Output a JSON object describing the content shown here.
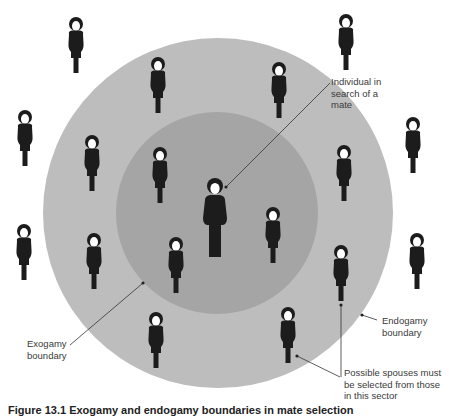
{
  "diagram": {
    "colors": {
      "background": "#ffffff",
      "outer_ring": "#bdbdbd",
      "inner_circle": "#a5a5a5",
      "figure": "#1c1c1c",
      "face": "#ffffff",
      "leader_line": "#333333"
    },
    "circles": {
      "outer": {
        "name": "endogamy-zone",
        "cx": 218,
        "cy": 213,
        "r": 175
      },
      "inner": {
        "name": "exogamy-zone",
        "cx": 217,
        "cy": 213,
        "r": 101
      }
    },
    "focal_individual": {
      "x": 215,
      "y": 178,
      "scale": 1.35
    },
    "figures": [
      {
        "zone": "outside",
        "x": 76,
        "y": 17
      },
      {
        "zone": "outside",
        "x": 346,
        "y": 14
      },
      {
        "zone": "outside",
        "x": 25,
        "y": 110
      },
      {
        "zone": "outside",
        "x": 413,
        "y": 117
      },
      {
        "zone": "outside",
        "x": 24,
        "y": 224
      },
      {
        "zone": "outside",
        "x": 417,
        "y": 233
      },
      {
        "zone": "endogamy-ring",
        "x": 158,
        "y": 57
      },
      {
        "zone": "endogamy-ring",
        "x": 279,
        "y": 62
      },
      {
        "zone": "endogamy-ring",
        "x": 92,
        "y": 135
      },
      {
        "zone": "endogamy-ring",
        "x": 344,
        "y": 145
      },
      {
        "zone": "endogamy-ring",
        "x": 94,
        "y": 233
      },
      {
        "zone": "endogamy-ring",
        "x": 341,
        "y": 245
      },
      {
        "zone": "endogamy-ring",
        "x": 156,
        "y": 312
      },
      {
        "zone": "endogamy-ring",
        "x": 288,
        "y": 307
      },
      {
        "zone": "exogamy-circle",
        "x": 160,
        "y": 147
      },
      {
        "zone": "exogamy-circle",
        "x": 273,
        "y": 207
      },
      {
        "zone": "exogamy-circle",
        "x": 176,
        "y": 237
      }
    ],
    "labels": {
      "individual": "Individual in\nsearch of a\nmate",
      "exogamy": "Exogamy\nboundary",
      "endogamy": "Endogamy\nboundary",
      "spouses": "Possible spouses must\nbe selected from those\nin this sector"
    },
    "caption": "Figure 13.1 Exogamy and endogamy boundaries in mate selection"
  }
}
